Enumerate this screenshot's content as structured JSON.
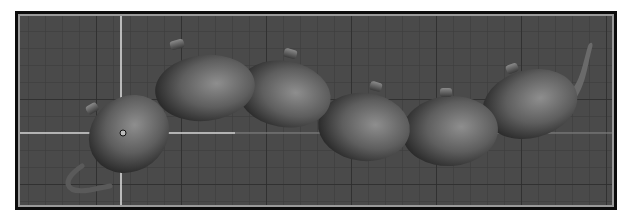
{
  "viewport": {
    "type": "3d-viewport",
    "background_color": "#4a4a4a",
    "grid": {
      "minor_spacing_px": 17,
      "minor_color": "#3c3c3c",
      "major_color": "#2e2e2e"
    },
    "home_grid_axes": {
      "color": "#d8d8d8",
      "horizontal_y": 117,
      "vertical_x": 101
    },
    "object": {
      "name": "teapot-chain",
      "segment_count": 6,
      "segments": [
        {
          "id": "segment-1",
          "cx": 109,
          "cy": 118,
          "rx": 42,
          "ry": 37,
          "rotation": -38,
          "has_handle": true,
          "has_lid_knob": true
        },
        {
          "id": "segment-2",
          "cx": 185,
          "cy": 72,
          "rx": 50,
          "ry": 33,
          "rotation": -6,
          "has_lid_knob": true
        },
        {
          "id": "segment-3",
          "cx": 264,
          "cy": 78,
          "rx": 47,
          "ry": 33,
          "rotation": 10,
          "has_lid_knob": true
        },
        {
          "id": "segment-4",
          "cx": 344,
          "cy": 111,
          "rx": 46,
          "ry": 34,
          "rotation": 6,
          "has_lid_knob": true
        },
        {
          "id": "segment-5",
          "cx": 430,
          "cy": 115,
          "rx": 48,
          "ry": 35,
          "rotation": -4,
          "has_lid_knob": true
        },
        {
          "id": "segment-6",
          "cx": 510,
          "cy": 88,
          "rx": 48,
          "ry": 34,
          "rotation": -14,
          "has_lid_knob": true,
          "has_spout": true
        }
      ],
      "pivot_marker": {
        "x": 103,
        "y": 117
      }
    }
  }
}
